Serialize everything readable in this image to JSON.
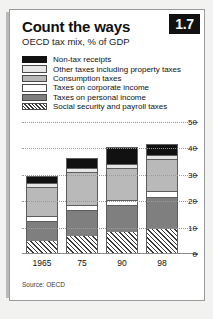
{
  "card": {
    "badge": "1.7",
    "title": "Count the ways",
    "subtitle": "OECD tax mix, % of GDP",
    "source": "Source: OECD"
  },
  "legend": {
    "items": [
      {
        "label": "Non-tax receipts",
        "swatch": "nontax",
        "color": "#111111"
      },
      {
        "label": "Other taxes including property taxes",
        "swatch": "other",
        "color": "#e6e6e6"
      },
      {
        "label": "Consumption taxes",
        "swatch": "consumption",
        "color": "#b9b9b9"
      },
      {
        "label": "Taxes on corporate income",
        "swatch": "corporate",
        "color": "#ffffff"
      },
      {
        "label": "Taxes on personal income",
        "swatch": "personal",
        "color": "#7f7f7f"
      },
      {
        "label": "Social security and payroll taxes",
        "swatch": "social",
        "color": "#ffffff"
      }
    ]
  },
  "chart_data": {
    "type": "bar",
    "stacked": true,
    "title": "Count the ways",
    "subtitle": "OECD tax mix, % of GDP",
    "xlabel": "",
    "ylabel": "% of GDP",
    "ylim": [
      0,
      50
    ],
    "yticks": [
      0,
      10,
      20,
      30,
      40,
      50
    ],
    "grid": true,
    "legend_position": "top",
    "categories": [
      "1965",
      "75",
      "90",
      "98"
    ],
    "series": [
      {
        "name": "Social security and payroll taxes",
        "color": "#ffffff",
        "values": [
          5.0,
          7.0,
          8.5,
          9.5
        ]
      },
      {
        "name": "Taxes on personal income",
        "color": "#7f7f7f",
        "values": [
          7.5,
          9.5,
          10.0,
          12.0
        ]
      },
      {
        "name": "Taxes on corporate income",
        "color": "#ffffff",
        "values": [
          2.0,
          2.0,
          2.0,
          2.5
        ]
      },
      {
        "name": "Consumption taxes",
        "color": "#b9b9b9",
        "values": [
          11.0,
          12.5,
          12.0,
          12.0
        ]
      },
      {
        "name": "Other taxes including property taxes",
        "color": "#e6e6e6",
        "values": [
          1.5,
          1.5,
          1.5,
          1.5
        ]
      },
      {
        "name": "Non-tax receipts",
        "color": "#111111",
        "values": [
          2.5,
          4.0,
          6.5,
          4.0
        ]
      }
    ],
    "totals": [
      29.5,
      36.5,
      40.5,
      41.5
    ]
  }
}
